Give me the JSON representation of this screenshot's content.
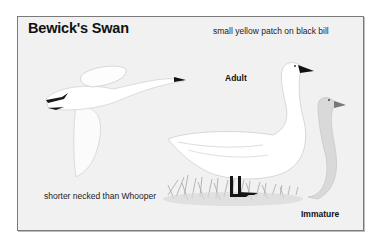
{
  "plate": {
    "title": "Bewick's Swan",
    "captions": {
      "bill": "small yellow patch on black bill",
      "neck": "shorter necked than Whooper"
    },
    "labels": {
      "adult": "Adult",
      "immature": "Immature"
    },
    "illustrations": [
      "flying-swan",
      "adult-swan",
      "immature-swan",
      "grass-tuft"
    ],
    "colors": {
      "background": "#f1f1f1",
      "border": "#7a7a7a",
      "bill": "#111111",
      "immature_plumage": "#c8c8c8"
    }
  }
}
